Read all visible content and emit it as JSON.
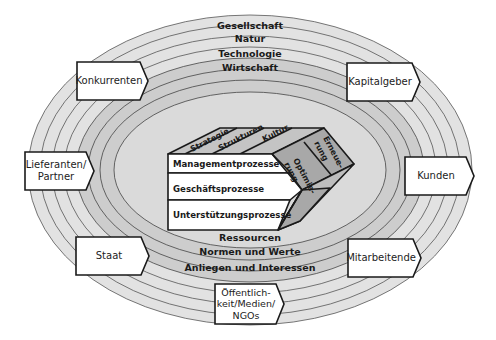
{
  "diagram": {
    "colors": {
      "outer_ring": "#e0e0e0",
      "middle_ring": "#cfcfcf",
      "inner_ellipse": "#dcdcdc",
      "box_fill": "#ffffff",
      "cube_side": "#a8a8a8",
      "cube_top": "#c4c4c4",
      "stroke": "#1a1a1a"
    },
    "environment_spheres": [
      "Gesellschaft",
      "Natur",
      "Technologie",
      "Wirtschaft"
    ],
    "interaction_issues": [
      "Ressourcen",
      "Normen und Werte",
      "Anliegen und Interessen"
    ],
    "processes": [
      "Managementprozesse",
      "Geschäftsprozesse",
      "Unterstützungsprozesse"
    ],
    "ordering_forces": [
      "Strategie",
      "Strukturen",
      "Kultur"
    ],
    "development_modes": [
      {
        "line1": "Optimie-",
        "line2": "rung"
      },
      {
        "line1": "Erneue-",
        "line2": "rung"
      }
    ],
    "stakeholders": {
      "konkurrenten": "Konkurrenten",
      "kapitalgeber": "Kapitalgeber",
      "lieferanten_line1": "Lieferanten/",
      "lieferanten_line2": "Partner",
      "kunden": "Kunden",
      "staat": "Staat",
      "mitarbeitende": "Mitarbeitende",
      "oeffentlichkeit_line1": "Öffentlich-",
      "oeffentlichkeit_line2": "keit/Medien/",
      "oeffentlichkeit_line3": "NGOs"
    }
  }
}
